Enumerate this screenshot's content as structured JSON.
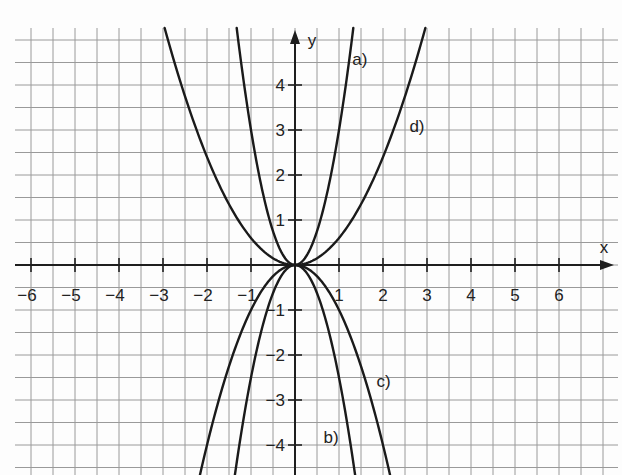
{
  "chart_data": {
    "type": "line",
    "title": "",
    "xlabel": "x",
    "ylabel": "y",
    "xlim": [
      -6.5,
      7.3
    ],
    "ylim": [
      -4.67,
      5.27
    ],
    "grid": true,
    "grid_step": 0.5,
    "x_ticks": [
      -6,
      -5,
      -4,
      -3,
      -2,
      -1,
      1,
      2,
      3,
      4,
      5,
      6
    ],
    "x_tick_labels": [
      "−6",
      "−5",
      "−4",
      "−3",
      "−2",
      "−1",
      "1",
      "2",
      "3",
      "4",
      "5",
      "6"
    ],
    "y_ticks": [
      4,
      3,
      2,
      1,
      -1,
      -2,
      -3,
      -4
    ],
    "y_tick_labels": [
      "4",
      "3",
      "2",
      "1",
      "−1",
      "−2",
      "−3",
      "−4"
    ],
    "series": [
      {
        "name": "a)",
        "formula": "y = 3x²",
        "coef": 3,
        "label_pos": [
          1.3,
          4.45
        ]
      },
      {
        "name": "b)",
        "formula": "y = −2.5x²",
        "coef": -2.5,
        "label_pos": [
          0.65,
          -3.95
        ]
      },
      {
        "name": "c)",
        "formula": "y = −x²",
        "coef": -1,
        "label_pos": [
          1.85,
          -2.7
        ]
      },
      {
        "name": "d)",
        "formula": "y = 0.6x²",
        "coef": 0.6,
        "label_pos": [
          2.6,
          2.95
        ]
      }
    ]
  },
  "layout": {
    "origin_px": [
      295,
      265
    ],
    "unit_x_px": 44,
    "unit_y_px": 45,
    "grid_left_px": 15,
    "grid_right_px": 618,
    "grid_top_px": 28,
    "grid_bottom_px": 475,
    "axis_x_end_px": 614,
    "axis_y_top_px": 30,
    "colors": {
      "grid": "#9a9a9a",
      "axis": "#1e1e1e",
      "curve": "#1a1a1a",
      "paper": "#fdfdfd"
    }
  }
}
